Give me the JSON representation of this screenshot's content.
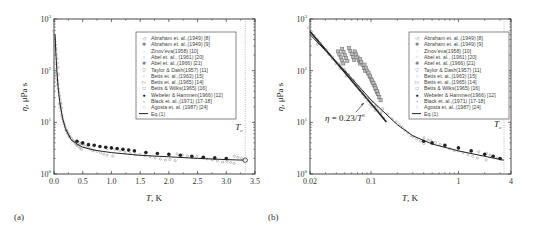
{
  "figure": {
    "panels": [
      "(a)",
      "(b)"
    ]
  },
  "legend_entries": [
    "Abraham et. al.,(1949) [8]",
    "Abraham et. al.,(1949) [9]",
    "Zinov'eva(1958) [10]",
    "Abel et. al., (1961) [20]",
    "Abel et. al.,(1966) [21]",
    "Taylor & Dash(1957) [11]",
    "Betts et. al.,(1963) [15]",
    "Betts et. al.,(1965) [14]",
    "Betts & Wilks(1965) [16]",
    "Webeler & Hammen(1966) [12]",
    "Black et. al.,(1971) [17-18]",
    "Agosta et. al.,(1987) [24]",
    "Eq.(1)"
  ],
  "chart_data": [
    {
      "type": "scatter",
      "panel": "(a)",
      "title": "",
      "xlabel": "T, K",
      "ylabel": "η, μPa s",
      "xscale": "linear",
      "yscale": "log",
      "xlim": [
        0.0,
        3.5
      ],
      "ylim": [
        1,
        1000
      ],
      "xticks": [
        "0.0",
        "0.5",
        "1.0",
        "1.5",
        "2.0",
        "2.5",
        "3.0",
        "3.5"
      ],
      "yticks": [
        "10^0",
        "10^1",
        "10^2",
        "10^3"
      ],
      "legend_position": "upper right",
      "annotation": "Tc",
      "tc_line_x": 3.33,
      "series": [
        {
          "name": "Eq.(1)",
          "x": [
            0.02,
            0.03,
            0.05,
            0.07,
            0.1,
            0.15,
            0.2,
            0.3,
            0.4,
            0.5,
            0.7,
            1.0,
            1.5,
            2.0,
            2.5,
            3.0,
            3.33
          ],
          "y": [
            500,
            250,
            100,
            50,
            25,
            12,
            7.5,
            4.6,
            3.8,
            3.3,
            2.9,
            2.6,
            2.3,
            2.15,
            2.0,
            1.9,
            1.85
          ]
        },
        {
          "name": "Webeler & Hammen(1966) [12]",
          "x": [
            0.4,
            0.5,
            0.6,
            0.7,
            0.8,
            0.9,
            1.0,
            1.1,
            1.2,
            1.3,
            1.4,
            1.6,
            1.8,
            2.0,
            2.2,
            2.4,
            2.6,
            2.8,
            3.0
          ],
          "y": [
            4.3,
            4.0,
            3.7,
            3.6,
            3.4,
            3.3,
            3.2,
            3.1,
            3.0,
            2.9,
            2.8,
            2.6,
            2.5,
            2.4,
            2.3,
            2.2,
            2.1,
            2.05,
            2.0
          ]
        },
        {
          "name": "Agosta et. al.,(1987) [24]",
          "x": [
            3.33
          ],
          "y": [
            1.85
          ]
        },
        {
          "name": "Other data (lower scatter)",
          "x": [
            0.3,
            0.5,
            0.7,
            1.0,
            1.3,
            1.6,
            2.0,
            2.4,
            2.8,
            3.2
          ],
          "y": [
            3.5,
            2.9,
            2.6,
            2.3,
            2.1,
            2.0,
            1.95,
            1.9,
            1.8,
            1.75
          ]
        }
      ]
    },
    {
      "type": "scatter",
      "panel": "(b)",
      "title": "",
      "xlabel": "T, K",
      "ylabel": "η, μPa s",
      "xscale": "log",
      "yscale": "log",
      "xlim": [
        0.02,
        4
      ],
      "ylim": [
        1,
        1000
      ],
      "xticks": [
        "0.02",
        "0.1",
        "1",
        "4"
      ],
      "yticks": [
        "10^0",
        "10^1",
        "10^2",
        "10^3"
      ],
      "legend_position": "upper right",
      "annotations": [
        "η = 0.23/T²",
        "Tc"
      ],
      "tc_line_x": 3.33,
      "series": [
        {
          "name": "η = 0.23/T²",
          "x": [
            0.02,
            0.03,
            0.05,
            0.07,
            0.1,
            0.15
          ],
          "y": [
            575,
            256,
            92,
            47,
            23,
            10.2
          ]
        },
        {
          "name": "Eq.(1)",
          "x": [
            0.02,
            0.05,
            0.1,
            0.2,
            0.3,
            0.5,
            1.0,
            2.0,
            3.33
          ],
          "y": [
            500,
            100,
            27,
            9.0,
            5.5,
            3.8,
            2.8,
            2.2,
            1.85
          ]
        },
        {
          "name": "Betts & Wilks(1965) [16]",
          "x": [
            0.045,
            0.05,
            0.06,
            0.07,
            0.08,
            0.09,
            0.1,
            0.11,
            0.12
          ],
          "y": [
            180,
            200,
            210,
            180,
            130,
            100,
            70,
            50,
            35
          ]
        },
        {
          "name": "Webeler & Hammen(1966) [12]",
          "x": [
            0.4,
            0.5,
            0.7,
            1.0,
            1.4,
            2.0,
            2.5,
            3.0
          ],
          "y": [
            4.3,
            4.0,
            3.6,
            3.2,
            2.8,
            2.4,
            2.2,
            2.0
          ]
        }
      ]
    }
  ]
}
